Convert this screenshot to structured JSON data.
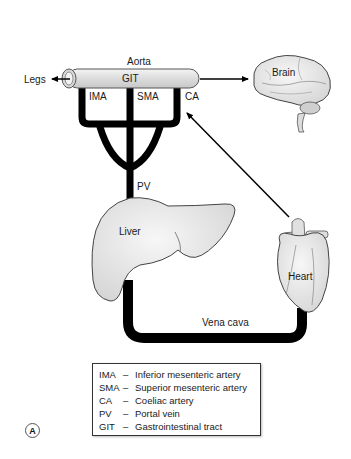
{
  "diagram": {
    "labels": {
      "aorta": "Aorta",
      "git": "GIT",
      "legs": "Legs",
      "ima": "IMA",
      "sma": "SMA",
      "ca": "CA",
      "pv": "PV",
      "brain": "Brain",
      "liver": "Liver",
      "heart": "Heart",
      "vena_cava": "Vena cava"
    },
    "legend": [
      {
        "abbr": "IMA",
        "dash": "–",
        "meaning": "Inferior mesenteric artery"
      },
      {
        "abbr": "SMA",
        "dash": "–",
        "meaning": "Superior mesenteric artery"
      },
      {
        "abbr": "CA",
        "dash": "–",
        "meaning": "Coeliac artery"
      },
      {
        "abbr": "PV",
        "dash": "–",
        "meaning": "Portal vein"
      },
      {
        "abbr": "GIT",
        "dash": "–",
        "meaning": "Gastrointestinal tract"
      }
    ],
    "panel_label": "A",
    "colors": {
      "vessel": "#000000",
      "organ_fill": "#e6e6e6",
      "organ_stroke": "#444444"
    }
  }
}
